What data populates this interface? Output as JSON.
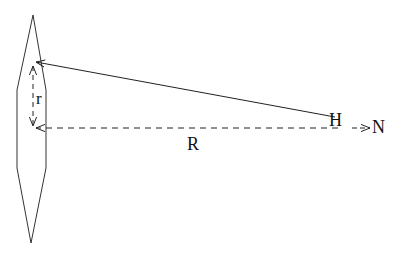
{
  "diagram": {
    "type": "geometric-schematic",
    "colors": {
      "stroke": "#222222",
      "background": "#ffffff"
    },
    "labels": {
      "H": "H",
      "N": "N",
      "R": "R",
      "r": "r"
    },
    "shapes": {
      "lens_polygon": [
        [
          33,
          15
        ],
        [
          46,
          90
        ],
        [
          46,
          168
        ],
        [
          31,
          243
        ],
        [
          17,
          168
        ],
        [
          17,
          90
        ]
      ],
      "solid_line": {
        "from": [
          335,
          117
        ],
        "to": [
          35,
          62
        ]
      },
      "dashed_line_R": {
        "from": [
          338,
          128
        ],
        "to": [
          35,
          128
        ]
      },
      "dashed_arrow_N": {
        "from": [
          352,
          128
        ],
        "to": [
          370,
          128
        ]
      },
      "r_arrow": {
        "from": [
          33,
          64
        ],
        "to": [
          33,
          126
        ]
      }
    }
  }
}
